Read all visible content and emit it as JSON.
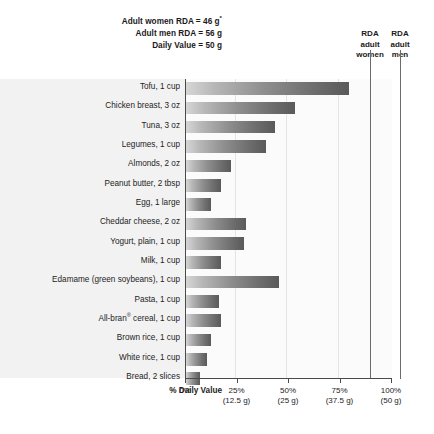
{
  "header": {
    "notes": [
      "Adult women RDA = 46 g*",
      "Adult men RDA = 56 g",
      "Daily Value = 50 g"
    ],
    "note_women_text": "Adult women RDA = 46 g",
    "note_women_superscript": "*",
    "note_men": "Adult men RDA = 56 g",
    "note_daily_value": "Daily Value = 50 g",
    "rda_women": {
      "line1": "RDA",
      "line2": "adult",
      "line3": "women"
    },
    "rda_men": {
      "line1": "RDA",
      "line2": "adult",
      "line3": "men"
    }
  },
  "axis": {
    "caption": "% Daily Value",
    "ticks": [
      {
        "percent": "0%",
        "grams": ""
      },
      {
        "percent": "25%",
        "grams": "(12.5 g)"
      },
      {
        "percent": "50%",
        "grams": "(25 g)"
      },
      {
        "percent": "75%",
        "grams": "(37.5 g)"
      },
      {
        "percent": "100%",
        "grams": "(50 g)"
      }
    ]
  },
  "chart_data": {
    "type": "bar",
    "orientation": "horizontal",
    "title": "",
    "xlabel": "% Daily Value",
    "ylabel": "",
    "xlim": [
      0,
      100
    ],
    "xticks": [
      0,
      25,
      50,
      75,
      100
    ],
    "xtick_labels": [
      "0%",
      "25%",
      "50%",
      "75%",
      "100%"
    ],
    "xtick_sublabels": [
      "",
      "(12.5 g)",
      "(25 g)",
      "(37.5 g)",
      "(50 g)"
    ],
    "grid": true,
    "legend": "none",
    "reference_lines": [
      {
        "name": "RDA adult women",
        "value": 92,
        "grams": 46
      },
      {
        "name": "RDA adult men",
        "value": 112,
        "grams": 56
      }
    ],
    "annotations": [
      "Adult women RDA = 46 g*",
      "Adult men RDA = 56 g",
      "Daily Value = 50 g"
    ],
    "categories": [
      "Tofu, 1 cup",
      "Chicken breast, 3 oz",
      "Tuna, 3 oz",
      "Legumes, 1 cup",
      "Almonds, 2 oz",
      "Peanut butter, 2 tbsp",
      "Egg, 1 large",
      "Cheddar cheese, 2 oz",
      "Yogurt, plain, 1 cup",
      "Milk, 1 cup",
      "Edamame (green soybeans), 1 cup",
      "Pasta, 1 cup",
      "All-bran® cereal, 1 cup",
      "Brown rice, 1 cup",
      "White rice, 1 cup",
      "Bread, 2 slices"
    ],
    "values": [
      79,
      53,
      43,
      39,
      22,
      17,
      12,
      29,
      28,
      17,
      45,
      16,
      17,
      12,
      10,
      7
    ]
  },
  "rows": [
    {
      "label": "Tofu, 1 cup",
      "label_main": "Tofu, 1 cup",
      "value": 79
    },
    {
      "label": "Chicken breast, 3 oz",
      "label_main": "Chicken breast, 3 oz",
      "value": 53
    },
    {
      "label": "Tuna, 3 oz",
      "label_main": "Tuna, 3 oz",
      "value": 43
    },
    {
      "label": "Legumes, 1 cup",
      "label_main": "Legumes, 1 cup",
      "value": 39
    },
    {
      "label": "Almonds, 2 oz",
      "label_main": "Almonds, 2 oz",
      "value": 22
    },
    {
      "label": "Peanut butter, 2 tbsp",
      "label_main": "Peanut butter, 2 tbsp",
      "value": 17
    },
    {
      "label": "Egg, 1 large",
      "label_main": "Egg, 1 large",
      "value": 12
    },
    {
      "label": "Cheddar cheese, 2 oz",
      "label_main": "Cheddar cheese, 2 oz",
      "value": 29
    },
    {
      "label": "Yogurt, plain, 1 cup",
      "label_main": "Yogurt, plain, 1 cup",
      "value": 28
    },
    {
      "label": "Milk, 1 cup",
      "label_main": "Milk, 1 cup",
      "value": 17
    },
    {
      "label": "Edamame (green soybeans), 1 cup",
      "label_main": "Edamame (green soybeans), 1 cup",
      "value": 45
    },
    {
      "label": "Pasta, 1 cup",
      "label_main": "Pasta, 1 cup",
      "value": 16
    },
    {
      "label": "All-bran® cereal, 1 cup",
      "label_main": "All-bran",
      "label_sup": "®",
      "label_tail": " cereal, 1 cup",
      "value": 17
    },
    {
      "label": "Brown rice, 1 cup",
      "label_main": "Brown rice, 1 cup",
      "value": 12
    },
    {
      "label": "White rice, 1 cup",
      "label_main": "White rice, 1 cup",
      "value": 10
    },
    {
      "label": "Bread, 2 slices",
      "label_main": "Bread, 2 slices",
      "value": 7
    }
  ],
  "colors": {
    "bar_light": "#d6d6d6",
    "bar_dark": "#5a5a5a",
    "band_background": "#f2f2f2",
    "plot_background": "#fbfbfb",
    "axis": "#4a4a4a",
    "text": "#1d1d1d"
  }
}
